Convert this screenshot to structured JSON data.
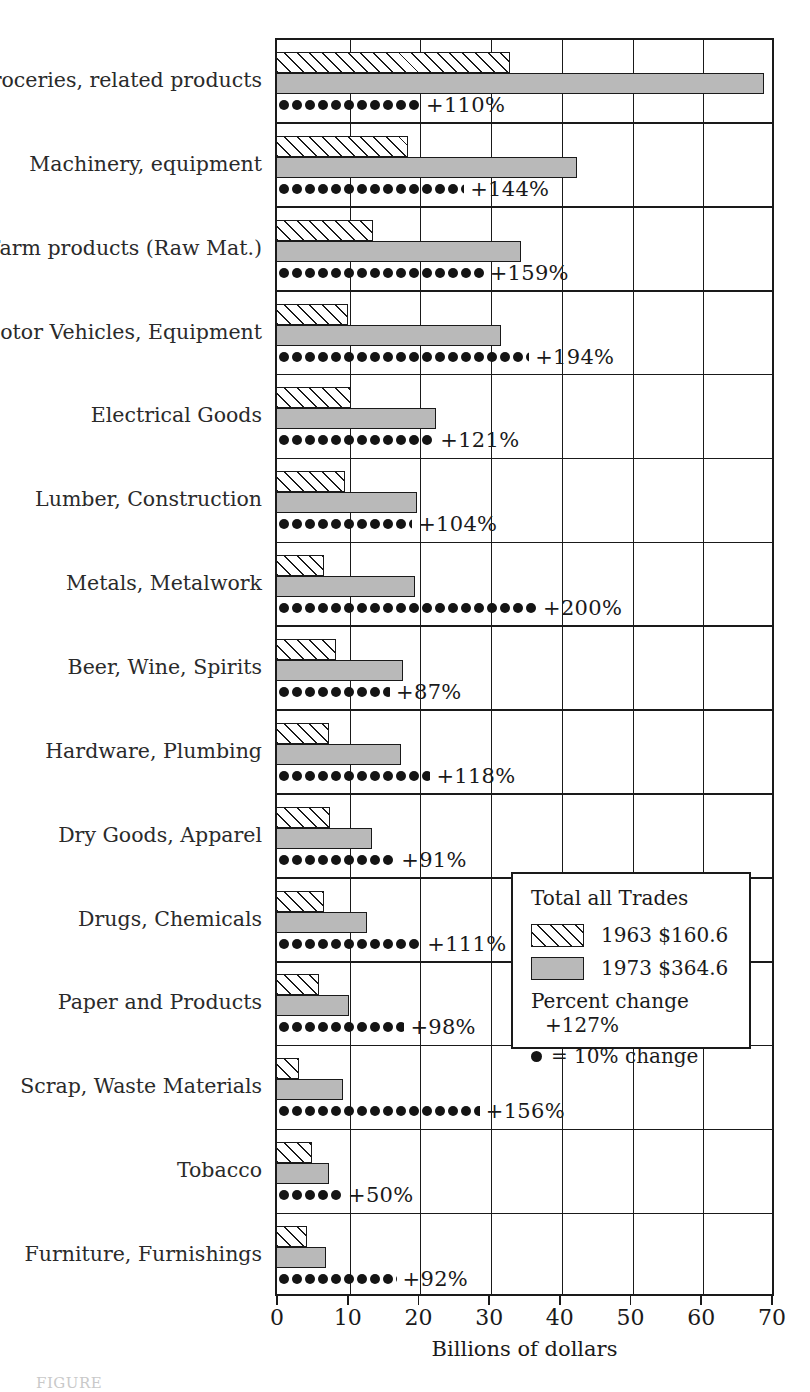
{
  "chart_data": {
    "type": "bar",
    "title": "",
    "xlabel": "Billions of dollars",
    "ylabel": "",
    "xlim": [
      0,
      70
    ],
    "xticks": [
      0,
      10,
      20,
      30,
      40,
      50,
      60,
      70
    ],
    "grid": true,
    "orientation": "horizontal",
    "legend_position": "inside-right-lower",
    "categories": [
      "Groceries, related products",
      "Machinery, equipment",
      "Farm products (Raw Mat.)",
      "Motor Vehicles, Equipment",
      "Electrical Goods",
      "Lumber, Construction",
      "Metals, Metalwork",
      "Beer, Wine, Spirits",
      "Hardware, Plumbing",
      "Dry Goods, Apparel",
      "Drugs, Chemicals",
      "Paper and Products",
      "Scrap, Waste Materials",
      "Tobacco",
      "Furniture, Furnishings"
    ],
    "series": [
      {
        "name": "1963",
        "values": [
          32.6,
          18.3,
          13.3,
          9.8,
          10.2,
          9.3,
          6.3,
          8.1,
          7.0,
          7.2,
          6.3,
          5.6,
          2.8,
          4.6,
          4.0
        ]
      },
      {
        "name": "1973",
        "values": [
          68.6,
          42.2,
          34.2,
          31.4,
          22.2,
          19.5,
          19.2,
          17.6,
          17.2,
          13.2,
          12.4,
          9.9,
          9.1,
          7.0,
          6.6
        ]
      }
    ],
    "percent_change": [
      "+110%",
      "+144%",
      "+159%",
      "+194%",
      "+121%",
      "+104%",
      "+200%",
      "+87%",
      "+118%",
      "+91%",
      "+111%",
      "+98%",
      "+156%",
      "+50%",
      "+92%"
    ],
    "percent_change_values": [
      110,
      144,
      159,
      194,
      121,
      104,
      200,
      87,
      118,
      91,
      111,
      98,
      156,
      50,
      92
    ],
    "dot_unit_percent": 10
  },
  "legend": {
    "title": "Total all Trades",
    "entries": [
      {
        "swatch": "hatched",
        "label": "1963 $160.6"
      },
      {
        "swatch": "solid-gray",
        "label": "1973 $364.6"
      }
    ],
    "percent_change_label": "Percent change",
    "percent_change_total": "+127%",
    "dot_key": "= 10% change"
  },
  "axis": {
    "x_title": "Billions of dollars",
    "tick_labels": [
      "0",
      "10",
      "20",
      "30",
      "40",
      "50",
      "60",
      "70"
    ]
  },
  "colors": {
    "bar_1973_fill": "#b9b9b9",
    "bar_1963_fill": "#ffffff",
    "line": "#1a1a1a",
    "dot": "#141414"
  },
  "caption": "FIGURE"
}
